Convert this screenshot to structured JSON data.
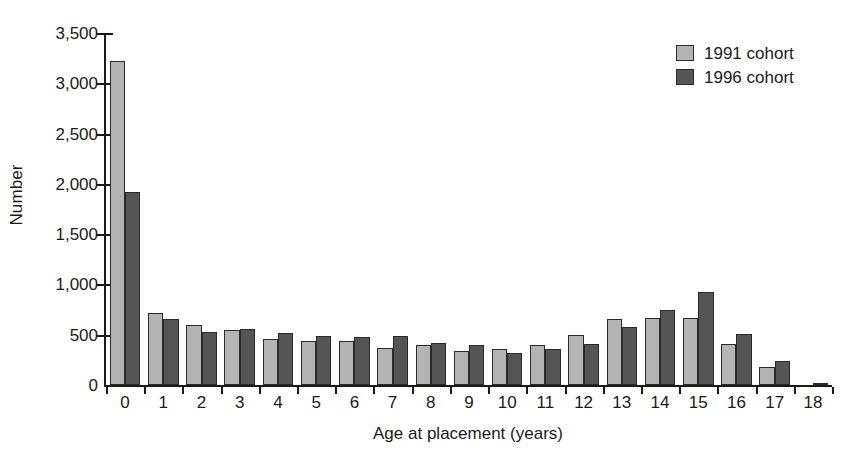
{
  "chart_data": {
    "type": "bar",
    "title": "",
    "xlabel": "Age at placement (years)",
    "ylabel": "Number",
    "categories": [
      "0",
      "1",
      "2",
      "3",
      "4",
      "5",
      "6",
      "7",
      "8",
      "9",
      "10",
      "11",
      "12",
      "13",
      "14",
      "15",
      "16",
      "17",
      "18"
    ],
    "series": [
      {
        "name": "1991 cohort",
        "color": "#b4b4b4",
        "values": [
          3220,
          720,
          595,
          545,
          455,
          440,
          435,
          370,
          395,
          340,
          360,
          400,
          500,
          655,
          670,
          665,
          410,
          180,
          0
        ]
      },
      {
        "name": "1996 cohort",
        "color": "#555555",
        "values": [
          1920,
          655,
          530,
          555,
          515,
          490,
          480,
          485,
          420,
          400,
          315,
          355,
          410,
          575,
          750,
          920,
          510,
          240,
          15
        ]
      }
    ],
    "ylim": [
      0,
      3500
    ],
    "ytick_values": [
      0,
      500,
      1000,
      1500,
      2000,
      2500,
      3000,
      3500
    ],
    "ytick_labels": [
      "0",
      "500",
      "1,000",
      "1,500",
      "2,000",
      "2,500",
      "3,000",
      "3,500"
    ],
    "grid": false,
    "legend_position": "top-right"
  },
  "legend": {
    "entries": [
      {
        "label": "1991 cohort"
      },
      {
        "label": "1996 cohort"
      }
    ]
  },
  "axes": {
    "y_title": "Number",
    "x_title": "Age at placement (years)"
  }
}
